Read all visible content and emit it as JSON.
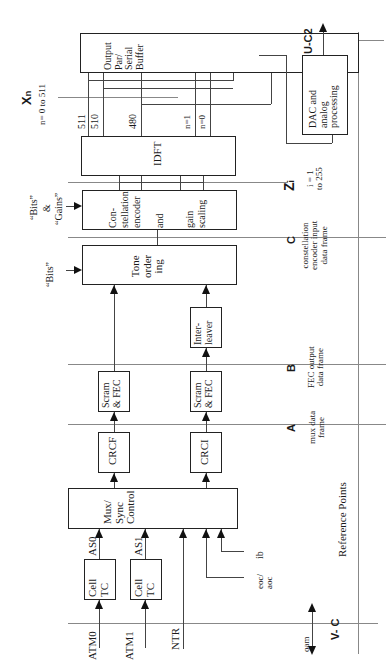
{
  "blocks": {
    "cell_tc_0": "Cell\nTC",
    "cell_tc_1": "Cell\nTC",
    "mux_sync": "Mux/\nSync\nControl",
    "crc_f": "CRCF",
    "crc_i": "CRCI",
    "scram_fec_f": "Scram\n& FEC",
    "scram_fec_i": "Scram\n& FEC",
    "interleaver": "Inter-\nleaver",
    "tone_ordering": "Tone\norder\ning",
    "constellation": {
      "line1": "Con-",
      "line2": "stellation",
      "line3": "encoder",
      "line4": "and",
      "line5": "gain",
      "line6": "scaling"
    },
    "idft": "IDFT",
    "output_buffer": "Output\nPar/\nSerial\nBuffer",
    "dac": "DAC and\nanalog\nprocessing"
  },
  "inputs": {
    "atm0": "ATM0",
    "atm1": "ATM1",
    "ntr": "NTR",
    "as0": "AS0",
    "as1": "AS1",
    "eoc_aoc": "eoc/\naoc",
    "ib": "ib",
    "oam": "oam",
    "bits": "“Bits”",
    "bits_gains_1": "“Bits”",
    "bits_gains_2": "&",
    "bits_gains_3": "“Gains”"
  },
  "idft_outputs": {
    "n511": "511",
    "n510": "510",
    "n480": "480",
    "n1": "n=1",
    "n0": "n=0"
  },
  "reference_points": {
    "title": "Reference Points",
    "a": {
      "label": "A",
      "desc": "mux data\nframe"
    },
    "b": {
      "label": "B",
      "desc": "FEC output\ndata frame"
    },
    "c": {
      "label": "C",
      "desc": "constellation\nencoder input\ndata frame"
    },
    "zi": {
      "label": "Zi",
      "label_main": "Z",
      "label_sub": "i",
      "desc": "i = 1\nto 255"
    },
    "xn": {
      "label": "Xn",
      "label_main": "X",
      "label_sub": "n",
      "desc": "n= 0 to 511"
    },
    "uc2": {
      "label": "U-C2"
    },
    "vc": {
      "label": "V- C"
    }
  }
}
